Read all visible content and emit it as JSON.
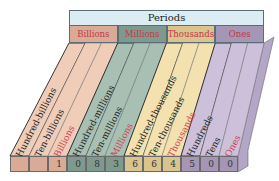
{
  "header": {
    "title": "Periods"
  },
  "periods": [
    {
      "name": "Billions",
      "color": "#efcdb8",
      "dark": "#d9ab96"
    },
    {
      "name": "Millions",
      "color": "#a8c0b4",
      "dark": "#7e9a8e"
    },
    {
      "name": "Thousands",
      "color": "#f3e2b0",
      "dark": "#d9c48e"
    },
    {
      "name": "Ones",
      "color": "#cdc0da",
      "dark": "#a596b6"
    }
  ],
  "columns": [
    {
      "label": "Hundred-billions",
      "period": 0,
      "digit": ""
    },
    {
      "label": "Ten-billions",
      "period": 0,
      "digit": ""
    },
    {
      "label": "Billions",
      "period": 0,
      "digit": "1",
      "is_period_name": true
    },
    {
      "label": "Hundred-millions",
      "period": 1,
      "digit": "0"
    },
    {
      "label": "Ten-millions",
      "period": 1,
      "digit": "8"
    },
    {
      "label": "Millions",
      "period": 1,
      "digit": "3",
      "is_period_name": true
    },
    {
      "label": "Hundred-thousands",
      "period": 2,
      "digit": "6"
    },
    {
      "label": "Ten-thousands",
      "period": 2,
      "digit": "6"
    },
    {
      "label": "Thousands",
      "period": 2,
      "digit": "4",
      "is_period_name": true
    },
    {
      "label": "Hundreds",
      "period": 3,
      "digit": "5"
    },
    {
      "label": "Tens",
      "period": 3,
      "digit": "0"
    },
    {
      "label": "Ones",
      "period": 3,
      "digit": "0",
      "is_period_name": true
    }
  ],
  "number": "1,083,664,500"
}
